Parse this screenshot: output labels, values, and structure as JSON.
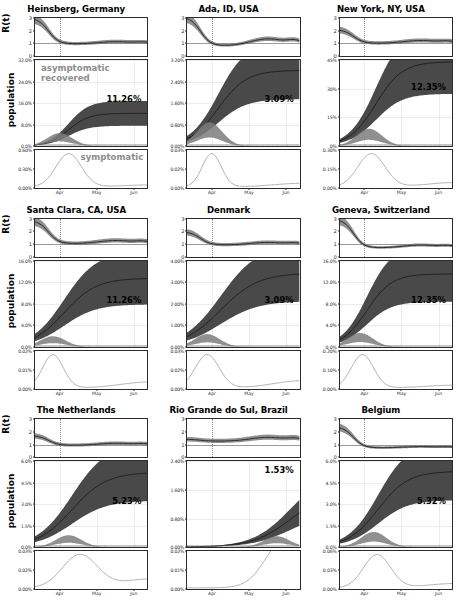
{
  "figure": {
    "ylabel_rt": "R(t)",
    "ylabel_population": "population",
    "annotation_asymptomatic": "asymptomatic\nrecovered",
    "annotation_asymptomatic_line1": "asymptomatic",
    "annotation_asymptomatic_line2": "recovered",
    "annotation_symptomatic": "symptomatic",
    "xticks": [
      "Apr",
      "May",
      "Jun"
    ],
    "rt_yticks": [
      "0",
      "1",
      "2",
      "3"
    ],
    "colors": {
      "band_dark": "#3a3a3a",
      "band_mid": "#7d7d7d",
      "band_light": "#b9b9b9",
      "line_dark": "#1c1c1c",
      "annotation_gray": "#8d8d8d",
      "axis": "#2b2b2b"
    }
  },
  "chart_data": {
    "type": "line",
    "xlabel": "",
    "ylabel": "population",
    "x": [
      "Apr",
      "May",
      "Jun"
    ],
    "panels": [
      {
        "title": "Heinsberg, Germany",
        "rt": {
          "ylim": [
            0,
            3
          ],
          "yticks": [
            "0",
            "1",
            "2",
            "3"
          ]
        },
        "recovered": {
          "ylim": [
            0,
            32.0
          ],
          "yticks": [
            "0.0%",
            "8.0%",
            "16.0%",
            "24.0%",
            "32.0%"
          ],
          "final_label": "11.26%"
        },
        "symptomatic": {
          "ylim": [
            0,
            0.6
          ],
          "yticks": [
            "0.00%",
            "0.30%",
            "0.60%"
          ]
        }
      },
      {
        "title": "Ada, ID, USA",
        "rt": {
          "ylim": [
            0,
            3
          ],
          "yticks": [
            "0",
            "1",
            "2",
            "3"
          ]
        },
        "recovered": {
          "ylim": [
            0,
            3.2
          ],
          "yticks": [
            "0.00%",
            "0.80%",
            "1.60%",
            "2.40%",
            "3.20%"
          ],
          "final_label": "3.09%"
        },
        "symptomatic": {
          "ylim": [
            0,
            0.03
          ],
          "yticks": [
            "0.00%",
            "0.02%",
            "0.03%"
          ]
        }
      },
      {
        "title": "New York, NY, USA",
        "rt": {
          "ylim": [
            0,
            3
          ],
          "yticks": [
            "0",
            "1",
            "2",
            "3"
          ]
        },
        "recovered": {
          "ylim": [
            0,
            45
          ],
          "yticks": [
            "0%",
            "15%",
            "30%",
            "45%"
          ],
          "final_label": "12.35%"
        },
        "symptomatic": {
          "ylim": [
            0,
            0.3
          ],
          "yticks": [
            "0.00%",
            "0.15%",
            "0.30%"
          ]
        }
      },
      {
        "title": "Santa Clara, CA, USA",
        "rt": {
          "ylim": [
            0,
            3
          ],
          "yticks": [
            "0",
            "1",
            "2",
            "3"
          ]
        },
        "recovered": {
          "ylim": [
            0,
            16.0
          ],
          "yticks": [
            "0.0%",
            "4.0%",
            "8.0%",
            "12.0%",
            "16.0%"
          ],
          "final_label": "11.26%"
        },
        "symptomatic": {
          "ylim": [
            0,
            0.02
          ],
          "yticks": [
            "0.00%",
            "0.01%",
            "0.02%"
          ]
        }
      },
      {
        "title": "Denmark",
        "rt": {
          "ylim": [
            0,
            3
          ],
          "yticks": [
            "0",
            "1",
            "2",
            "3"
          ]
        },
        "recovered": {
          "ylim": [
            0,
            4.0
          ],
          "yticks": [
            "0.00%",
            "1.00%",
            "2.00%",
            "3.00%",
            "4.00%"
          ],
          "final_label": "3.09%"
        },
        "symptomatic": {
          "ylim": [
            0,
            0.03
          ],
          "yticks": [
            "0.00%",
            "0.02%",
            "0.03%"
          ]
        }
      },
      {
        "title": "Geneva, Switzerland",
        "rt": {
          "ylim": [
            0,
            3
          ],
          "yticks": [
            "0",
            "1",
            "2",
            "3"
          ]
        },
        "recovered": {
          "ylim": [
            0,
            16.0
          ],
          "yticks": [
            "0.0%",
            "4.0%",
            "8.0%",
            "12.0%",
            "16.0%"
          ],
          "final_label": "12.35%"
        },
        "symptomatic": {
          "ylim": [
            0,
            0.2
          ],
          "yticks": [
            "0.00%",
            "0.10%",
            "0.20%"
          ]
        }
      },
      {
        "title": "The Netherlands",
        "rt": {
          "ylim": [
            0,
            3
          ],
          "yticks": [
            "0",
            "1",
            "2",
            "3"
          ]
        },
        "recovered": {
          "ylim": [
            0,
            6.0
          ],
          "yticks": [
            "0.0%",
            "1.5%",
            "3.0%",
            "4.5%",
            "6.0%"
          ],
          "final_label": "5.23%"
        },
        "symptomatic": {
          "ylim": [
            0,
            0.03
          ],
          "yticks": [
            "0.00%",
            "0.02%",
            "0.03%"
          ]
        }
      },
      {
        "title": "Rio Grande do Sul, Brazil",
        "rt": {
          "ylim": [
            0,
            3
          ],
          "yticks": [
            "0",
            "1",
            "2",
            "3"
          ]
        },
        "recovered": {
          "ylim": [
            0,
            2.4
          ],
          "yticks": [
            "0.00%",
            "0.80%",
            "1.60%",
            "2.40%"
          ],
          "final_label": "1.53%"
        },
        "symptomatic": {
          "ylim": [
            0,
            0.02
          ],
          "yticks": [
            "0.00%",
            "0.01%",
            "0.02%"
          ]
        }
      },
      {
        "title": "Belgium",
        "rt": {
          "ylim": [
            0,
            3
          ],
          "yticks": [
            "0",
            "1",
            "2",
            "3"
          ]
        },
        "recovered": {
          "ylim": [
            0,
            6.0
          ],
          "yticks": [
            "0.0%",
            "1.5%",
            "3.0%",
            "4.5%",
            "6.0%"
          ],
          "final_label": "5.32%"
        },
        "symptomatic": {
          "ylim": [
            0,
            0.06
          ],
          "yticks": [
            "0.00%",
            "0.03%",
            "0.06%"
          ]
        }
      }
    ]
  }
}
